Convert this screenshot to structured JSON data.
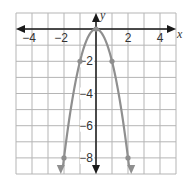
{
  "chart_data": {
    "type": "line",
    "title": "",
    "xlabel": "x",
    "ylabel": "y",
    "xlim": [
      -5,
      5
    ],
    "ylim": [
      -9,
      1
    ],
    "grid": true,
    "x_ticks": [
      -4,
      -2,
      2,
      4
    ],
    "x_tick_labels": [
      "−4",
      "−2",
      "2",
      "4"
    ],
    "y_ticks": [
      -2,
      -4,
      -6,
      -8
    ],
    "y_tick_labels": [
      "−2",
      "−4",
      "−6",
      "−8"
    ],
    "series": [
      {
        "name": "y = -2x^2",
        "function": "-2*x^2",
        "x_range": [
          -2.2,
          2.2
        ],
        "points": [
          {
            "x": -2,
            "y": -8
          },
          {
            "x": -1,
            "y": -2
          },
          {
            "x": 0,
            "y": 0
          },
          {
            "x": 1,
            "y": -2
          },
          {
            "x": 2,
            "y": -8
          }
        ],
        "arrows_at_ends": true
      }
    ],
    "colors": {
      "curve": "#8f8f8f",
      "axis": "#1a1a1a",
      "grid": "#b5b5b5"
    }
  }
}
